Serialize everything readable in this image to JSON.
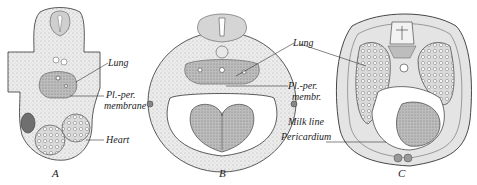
{
  "figure": {
    "panels": [
      {
        "id": "A",
        "letter": "A",
        "labels": {
          "lung": "Lung",
          "pl_per_1": "Pl.-per.",
          "pl_per_2": "membrane",
          "heart": "Heart"
        }
      },
      {
        "id": "B",
        "letter": "B",
        "labels": {
          "lung": "Lung",
          "pl_per_1": "Pl.-per.",
          "pl_per_2": "membr.",
          "milk_line": "Milk line",
          "pericardium": "Pericardium"
        }
      },
      {
        "id": "C",
        "letter": "C",
        "labels": {}
      }
    ],
    "colors": {
      "tissue_fill": "#e6e6e6",
      "dark_tissue": "#9a9a9a",
      "outline": "#333333",
      "background": "#ffffff"
    }
  }
}
